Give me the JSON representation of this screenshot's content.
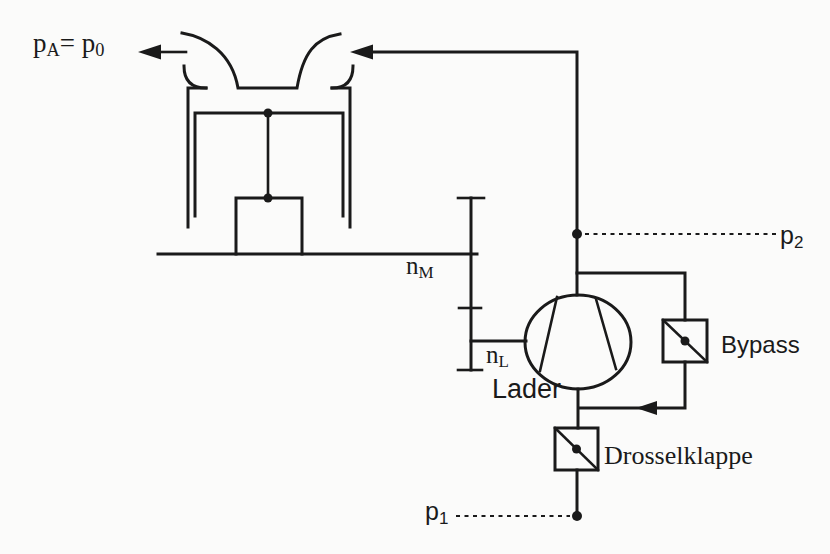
{
  "diagram": {
    "kind": "supercharged-engine-air-path-schematic",
    "colors": {
      "line": "#1a1a1a",
      "background": "#fbfbfa",
      "text": "#1a1a1a"
    },
    "labels": {
      "ambient_pressure": {
        "base": "p",
        "sub": "A",
        "mid": "= p",
        "sub2": "0"
      },
      "engine_speed": {
        "base": "n",
        "sub": "M"
      },
      "charger_speed": {
        "base": "n",
        "sub": "L"
      },
      "charger": "Lader",
      "bypass": "Bypass",
      "throttle": "Drosselklappe",
      "boost_pressure": {
        "base": "p",
        "sub": "2"
      },
      "intake_pressure": {
        "base": "p",
        "sub": "1"
      }
    }
  }
}
